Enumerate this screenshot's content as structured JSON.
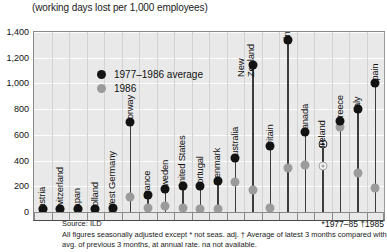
{
  "chart_data": {
    "type": "scatter",
    "title": "(working days lost per 1,000 employees)",
    "xlabel": "",
    "ylabel": "",
    "ylim": [
      0,
      1400
    ],
    "yticks": [
      0,
      200,
      400,
      600,
      800,
      1000,
      1200,
      1400
    ],
    "ytick_labels": [
      "0",
      "200",
      "400",
      "600",
      "800",
      "1,000",
      "1,200",
      "1,400"
    ],
    "grid": true,
    "legend_position": "top-left",
    "categories": [
      "Austria",
      "Switzerland",
      "Japan",
      "Holland",
      "West Germany",
      "Norway",
      "France",
      "Sweden",
      "United States",
      "Portugal",
      "Denmark",
      "Australia",
      "New Zealand",
      "Britain",
      "Finland",
      "Canada",
      "Ireland",
      "Greece",
      "Italy",
      "Spain"
    ],
    "series": [
      {
        "name": "1977–1986 average",
        "color": "#141414",
        "values": [
          10,
          15,
          20,
          25,
          35,
          700,
          135,
          180,
          205,
          200,
          245,
          420,
          1140,
          510,
          1340,
          620,
          530,
          705,
          800,
          1000
        ]
      },
      {
        "name": "1986",
        "color": "#9b9b9b",
        "values": [
          0,
          0,
          0,
          0,
          0,
          120,
          30,
          50,
          35,
          25,
          20,
          235,
          175,
          35,
          340,
          365,
          360,
          660,
          300,
          190
        ]
      }
    ],
    "hollow_markers": [
      "Ireland"
    ]
  },
  "legend": {
    "entries": [
      {
        "label": "1977–1986 average",
        "marker": "black-dot"
      },
      {
        "label": "1986",
        "marker": "gray-dot"
      }
    ]
  },
  "footer": {
    "source": "Source: ILD",
    "right_note": "*1977–85  †1985",
    "note_line1": "All figures seasonally adjusted except * not seas. adj. † Average of latest 3 months compared with avg.",
    "note_line2": "of previous 3 months, at annual rate. na not available."
  }
}
